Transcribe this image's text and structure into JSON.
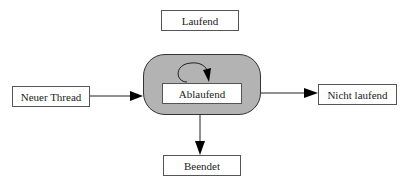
{
  "diagram": {
    "nodes": {
      "laufend": {
        "label": "Laufend"
      },
      "ablaufend": {
        "label": "Ablaufend"
      },
      "neuer_thread": {
        "label": "Neuer Thread"
      },
      "nicht_laufend": {
        "label": "Nicht laufend"
      },
      "beendet": {
        "label": "Beendet"
      }
    },
    "container": {
      "fill": "#b3b3b3"
    },
    "edges": [
      {
        "from": "Neuer Thread",
        "to": "Ablaufend"
      },
      {
        "from": "Ablaufend",
        "to": "Nicht laufend"
      },
      {
        "from": "Ablaufend",
        "to": "Beendet"
      },
      {
        "from": "Ablaufend",
        "to": "Ablaufend"
      }
    ]
  }
}
